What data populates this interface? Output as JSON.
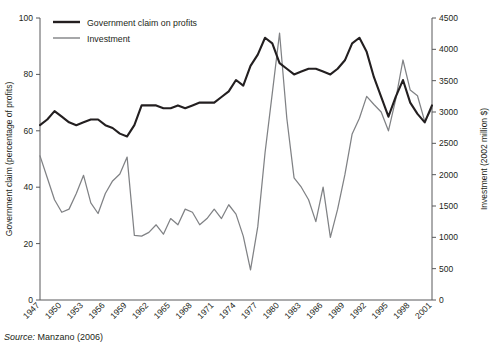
{
  "source": {
    "label": "Source:",
    "text": "Manzano (2006)"
  },
  "legend": {
    "position": "top-left",
    "items": [
      {
        "name": "Government claim on profits",
        "color": "#231f20"
      },
      {
        "name": "Investment",
        "color": "#808285"
      }
    ]
  },
  "chart_data": {
    "type": "line",
    "title": "",
    "subtitle": "",
    "xlabel": "",
    "ylabel": "Government claim (percentage of profits)",
    "y2label": "Investment (2002 million $)",
    "grid": false,
    "legend_position": "top-left",
    "xlim": [
      1947,
      2001
    ],
    "ylim": [
      0,
      100
    ],
    "y2lim": [
      0,
      4500
    ],
    "yticks": [
      0,
      20,
      40,
      60,
      80,
      100
    ],
    "y2ticks": [
      0,
      500,
      1000,
      1500,
      2000,
      2500,
      3000,
      3500,
      4000,
      4500
    ],
    "xticklabels": [
      "1947",
      "1950",
      "1953",
      "1956",
      "1959",
      "1962",
      "1965",
      "1968",
      "1971",
      "1974",
      "1977",
      "1980",
      "1983",
      "1986",
      "1989",
      "1992",
      "1995",
      "1998",
      "2001"
    ],
    "x": [
      1947,
      1948,
      1949,
      1950,
      1951,
      1952,
      1953,
      1954,
      1955,
      1956,
      1957,
      1958,
      1959,
      1960,
      1961,
      1962,
      1963,
      1964,
      1965,
      1966,
      1967,
      1968,
      1969,
      1970,
      1971,
      1972,
      1973,
      1974,
      1975,
      1976,
      1977,
      1978,
      1979,
      1980,
      1981,
      1982,
      1983,
      1984,
      1985,
      1986,
      1987,
      1988,
      1989,
      1990,
      1991,
      1992,
      1993,
      1994,
      1995,
      1996,
      1997,
      1998,
      1999,
      2000,
      2001
    ],
    "series": [
      {
        "name": "Government claim on profits",
        "axis": "left",
        "color": "#231f20",
        "units": "percentage of profits",
        "values": [
          62,
          64,
          67,
          65,
          63,
          62,
          63,
          64,
          64,
          62,
          61,
          59,
          58,
          62,
          69,
          69,
          69,
          68,
          68,
          69,
          68,
          69,
          70,
          70,
          70,
          72,
          74,
          78,
          76,
          83,
          87,
          93,
          91,
          84,
          82,
          80,
          81,
          82,
          82,
          81,
          80,
          82,
          85,
          91,
          93,
          88,
          79,
          72,
          65,
          72,
          78,
          70,
          66,
          63,
          69
        ]
      },
      {
        "name": "Investment",
        "axis": "right",
        "color": "#808285",
        "units": "2002 million $",
        "values": [
          2300,
          1950,
          1600,
          1400,
          1450,
          1700,
          1990,
          1550,
          1380,
          1700,
          1900,
          2010,
          2280,
          1030,
          1020,
          1080,
          1200,
          1050,
          1300,
          1200,
          1450,
          1400,
          1200,
          1300,
          1450,
          1300,
          1520,
          1370,
          1020,
          480,
          1170,
          2350,
          3300,
          4260,
          2900,
          1950,
          1800,
          1600,
          1250,
          1800,
          1000,
          1450,
          2000,
          2650,
          2900,
          3250,
          3120,
          3000,
          2700,
          3200,
          3830,
          3350,
          3260,
          2850,
          3060
        ]
      }
    ]
  }
}
